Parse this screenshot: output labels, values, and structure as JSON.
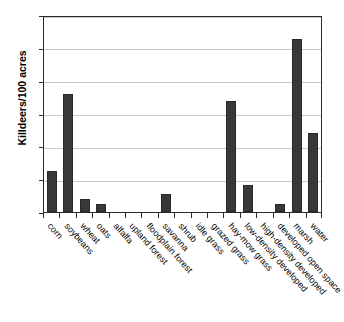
{
  "chart_data": {
    "type": "bar",
    "title": "",
    "xlabel": "",
    "ylabel": "Killdeers/100 acres",
    "ylim": [
      0,
      30
    ],
    "yticks": [
      0,
      5,
      10,
      15,
      20,
      25,
      30
    ],
    "grid": "horizontal",
    "legend": "none",
    "bar_color": "#383838",
    "categories": [
      "corn",
      "soybeans",
      "wheat",
      "oats",
      "alfalfa",
      "upland forest",
      "floodplain forest",
      "savanna",
      "shrub",
      "idle grass",
      "grazed grass",
      "hay-mow grass",
      "low-density developed",
      "high-density developed",
      "developed open space",
      "marsh",
      "water"
    ],
    "values": [
      6.3,
      17.9,
      2.0,
      1.2,
      0,
      0,
      0,
      2.8,
      0,
      0,
      0,
      16.9,
      4.1,
      0,
      1.2,
      26.3,
      12.1
    ]
  }
}
